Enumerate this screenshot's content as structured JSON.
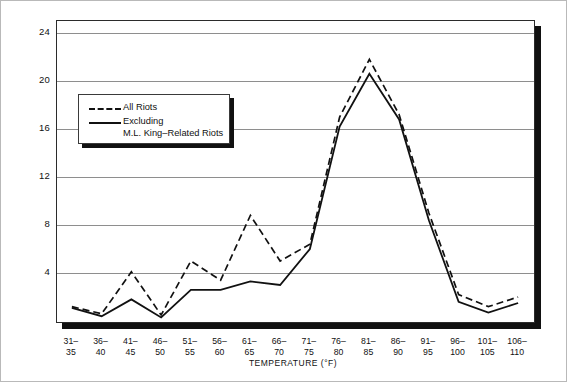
{
  "chart_data": {
    "type": "line",
    "title": "",
    "xlabel": "TEMPERATURE (°F)",
    "ylabel": "NUMBER OF RIOTS",
    "categories": [
      "31–35",
      "36–40",
      "41–45",
      "46–50",
      "51–55",
      "56–60",
      "61–65",
      "66–70",
      "71–75",
      "76–80",
      "81–85",
      "86–90",
      "91–95",
      "96–100",
      "101–105",
      "106–110"
    ],
    "category_lines": [
      [
        "31–",
        "35"
      ],
      [
        "36–",
        "40"
      ],
      [
        "41–",
        "45"
      ],
      [
        "46–",
        "50"
      ],
      [
        "51–",
        "55"
      ],
      [
        "56–",
        "60"
      ],
      [
        "61–",
        "65"
      ],
      [
        "66–",
        "70"
      ],
      [
        "71–",
        "75"
      ],
      [
        "76–",
        "80"
      ],
      [
        "81–",
        "85"
      ],
      [
        "86–",
        "90"
      ],
      [
        "91–",
        "95"
      ],
      [
        "96–",
        "100"
      ],
      [
        "101–",
        "105"
      ],
      [
        "106–",
        "110"
      ]
    ],
    "yticks": [
      4,
      8,
      12,
      16,
      20,
      24
    ],
    "ylim": [
      0,
      25
    ],
    "grid": true,
    "legend_position": "upper-left-inside",
    "series": [
      {
        "name": "All Riots",
        "style": "dashed",
        "color": "#111111",
        "values": [
          1.2,
          0.6,
          4.1,
          0.5,
          5.0,
          3.4,
          8.8,
          5.0,
          6.4,
          17.0,
          21.8,
          17.2,
          9.0,
          2.2,
          1.2,
          2.0
        ]
      },
      {
        "name": "Excluding M.L. King–Related Riots",
        "style": "solid",
        "color": "#111111",
        "values": [
          1.1,
          0.4,
          1.8,
          0.3,
          2.6,
          2.6,
          3.3,
          3.0,
          6.0,
          16.2,
          20.6,
          16.8,
          8.4,
          1.6,
          0.7,
          1.5
        ]
      }
    ]
  },
  "legend": {
    "entries": [
      {
        "label": "All Riots",
        "style": "dashed"
      },
      {
        "label_line1": "Excluding",
        "label_line2": "M.L. King–Related Riots",
        "style": "solid"
      }
    ]
  },
  "axes": {
    "y_title": "NUMBER OF RIOTS",
    "x_title": "TEMPERATURE (°F)"
  }
}
